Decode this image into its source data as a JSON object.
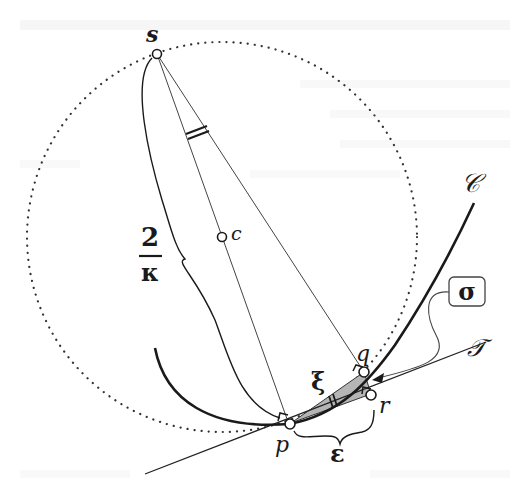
{
  "figure": {
    "type": "geometry-diagram",
    "colors": {
      "ink": "#1a1a1a",
      "thin_line": "#444444",
      "shade": "#b5b5b5",
      "background": "#ffffff"
    },
    "points": {
      "s": {
        "label": "s",
        "x": 157,
        "y": 54
      },
      "c": {
        "label": "c",
        "x": 222,
        "y": 237
      },
      "p": {
        "label": "p",
        "x": 289,
        "y": 424
      },
      "q": {
        "label": "q",
        "x": 364,
        "y": 373
      },
      "r": {
        "label": "r",
        "x": 371,
        "y": 395
      }
    },
    "circle": {
      "center": "c",
      "radius": 195,
      "style": "dotted"
    },
    "curve": {
      "label": "𝒞",
      "name": "C"
    },
    "tangent": {
      "label": "𝒯",
      "name": "T"
    },
    "brace_left": {
      "numerator": "2",
      "denominator": "κ"
    },
    "labels": {
      "xi": "ξ",
      "epsilon": "ε",
      "sigma": "σ"
    }
  }
}
